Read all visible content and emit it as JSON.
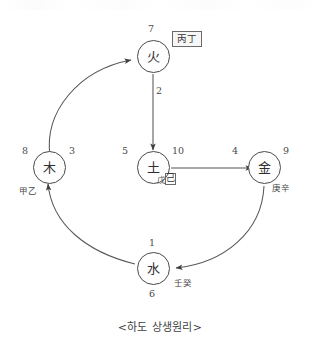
{
  "diagram": {
    "caption": "<하도 상생원리>",
    "title_glyph_font_note": "",
    "nodes": [
      {
        "id": "fire",
        "glyph": "火",
        "name_en": "Fire",
        "numbers": {
          "top": "7"
        },
        "stem_label": "丙丁",
        "stem_boxed": true
      },
      {
        "id": "wood",
        "glyph": "木",
        "name_en": "Wood",
        "numbers": {
          "left": "8",
          "right": "3"
        },
        "stem_label": "甲乙",
        "stem_boxed": false
      },
      {
        "id": "earth",
        "glyph": "土",
        "name_en": "Earth",
        "numbers": {
          "left": "5",
          "right": "10"
        },
        "stem_label_part1": "戊",
        "stem_label_part2": "己",
        "stem_boxed": true
      },
      {
        "id": "metal",
        "glyph": "金",
        "name_en": "Metal",
        "numbers": {
          "left": "4",
          "right": "9"
        },
        "stem_label": "庚辛",
        "stem_boxed": false
      },
      {
        "id": "water",
        "glyph": "水",
        "name_en": "Water",
        "numbers": {
          "top": "1",
          "bottom": "6"
        },
        "stem_label": "壬癸",
        "stem_boxed": false
      }
    ],
    "edges": [
      {
        "from": "wood",
        "to": "fire",
        "shape": "curve",
        "label": ""
      },
      {
        "from": "fire",
        "to": "earth",
        "shape": "straight",
        "label": "2"
      },
      {
        "from": "earth",
        "to": "metal",
        "shape": "straight",
        "label": ""
      },
      {
        "from": "metal",
        "to": "water",
        "shape": "curve",
        "label": ""
      },
      {
        "from": "water",
        "to": "wood",
        "shape": "curve",
        "label": ""
      }
    ],
    "colors": {
      "stroke": "#4a4a4a",
      "text": "#3a3a3a",
      "box_border": "#6a6a6a",
      "box_fill": "#f7f7f7",
      "background": "#ffffff"
    }
  }
}
